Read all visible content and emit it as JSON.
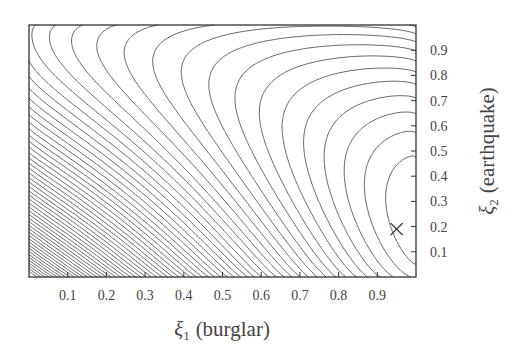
{
  "chart_data": {
    "type": "contour",
    "title": "",
    "xlabel": "ξ1 (burglar)",
    "xlabel_symbol": "ξ",
    "xlabel_sub": "1",
    "xlabel_text": "(burglar)",
    "ylabel": "ξ2 (earthquake)",
    "ylabel_symbol": "ξ",
    "ylabel_sub": "2",
    "ylabel_text": "(earthquake)",
    "xlim": [
      0,
      1
    ],
    "ylim": [
      0,
      1
    ],
    "x_ticks": [
      0.1,
      0.2,
      0.3,
      0.4,
      0.5,
      0.6,
      0.7,
      0.8,
      0.9
    ],
    "x_tick_labels": [
      "0.1",
      "0.2",
      "0.3",
      "0.4",
      "0.5",
      "0.6",
      "0.7",
      "0.8",
      "0.9"
    ],
    "y_ticks": [
      0.1,
      0.2,
      0.3,
      0.4,
      0.5,
      0.6,
      0.7,
      0.8,
      0.9
    ],
    "y_tick_labels": [
      "0.1",
      "0.2",
      "0.3",
      "0.4",
      "0.5",
      "0.6",
      "0.7",
      "0.8",
      "0.9"
    ],
    "y_axis_side": "right",
    "grid": false,
    "legend": null,
    "minimum_marker": {
      "symbol": "×",
      "x": 0.95,
      "y": 0.19
    },
    "contour_levels_count": 60,
    "line_color": "#555555",
    "frame_color": "#333333"
  }
}
